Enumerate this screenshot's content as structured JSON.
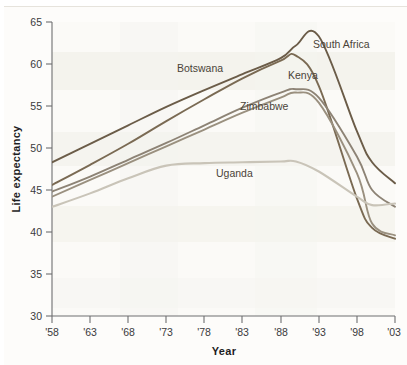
{
  "chart_data": {
    "type": "line",
    "title": "",
    "xlabel": "Year",
    "ylabel": "Life expectancy",
    "xlim": [
      1958,
      2003
    ],
    "ylim": [
      30,
      65
    ],
    "ytick_values": [
      30,
      35,
      40,
      45,
      50,
      55,
      60,
      65
    ],
    "ytick_labels": [
      "30",
      "35",
      "40",
      "45",
      "50",
      "55",
      "60",
      "65"
    ],
    "xtick_values": [
      1958,
      1963,
      1968,
      1973,
      1978,
      1983,
      1988,
      1993,
      1998,
      2003
    ],
    "xtick_labels": [
      "'58",
      "'63",
      "'68",
      "'73",
      "'78",
      "'83",
      "'88",
      "'93",
      "'98",
      "'03"
    ],
    "grid": "faint-horizontal-bands",
    "legend": "inline-series-labels",
    "x": [
      1958,
      1963,
      1968,
      1973,
      1978,
      1983,
      1988,
      1990,
      1993,
      1998,
      2000,
      2003
    ],
    "series": [
      {
        "name": "South Africa",
        "color": "#6b5c48",
        "label_x": 2000,
        "label_y": 61.5,
        "values": [
          48.3,
          50.5,
          52.7,
          54.9,
          56.9,
          58.8,
          60.7,
          62.2,
          63.3,
          52.0,
          48.3,
          45.8
        ]
      },
      {
        "name": "Botswana",
        "color": "#7a6a53",
        "label_x": 1983,
        "label_y": 59.0,
        "values": [
          45.6,
          48.0,
          50.5,
          53.2,
          55.8,
          58.3,
          60.4,
          61.0,
          57.4,
          44.0,
          40.5,
          39.2
        ]
      },
      {
        "name": "Kenya",
        "color": "#8d8375",
        "label_x": 1993,
        "label_y": 59.0,
        "values": [
          44.8,
          46.6,
          48.6,
          50.6,
          52.7,
          54.8,
          56.6,
          57.0,
          56.0,
          49.0,
          45.0,
          43.0
        ]
      },
      {
        "name": "Zimbabwe",
        "color": "#9a907f",
        "label_x": 1989,
        "label_y": 55.8,
        "values": [
          44.2,
          46.2,
          48.2,
          50.2,
          52.2,
          54.2,
          56.0,
          56.6,
          55.4,
          47.0,
          41.0,
          39.6
        ]
      },
      {
        "name": "Uganda",
        "color": "#c9c4b8",
        "label_x": 1982,
        "label_y": 46.4,
        "values": [
          43.0,
          44.6,
          46.4,
          47.9,
          48.2,
          48.3,
          48.4,
          48.4,
          47.2,
          44.2,
          43.2,
          43.4
        ]
      }
    ]
  },
  "axis": {
    "y_title": "Life expectancy",
    "x_title": "Year"
  }
}
